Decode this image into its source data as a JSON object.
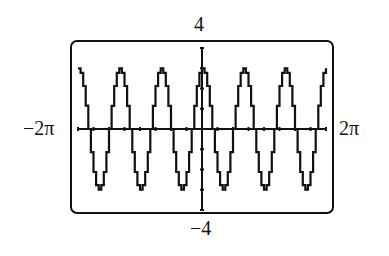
{
  "chart_data": {
    "type": "line",
    "title": "",
    "function": "y = 3cos(3x)",
    "xlabel": "",
    "ylabel": "",
    "xlim": [
      -6.2832,
      6.2832
    ],
    "ylim": [
      -4,
      4
    ],
    "x_tick_labels": {
      "min": "−2π",
      "max": "2π"
    },
    "y_tick_labels": {
      "max": "4",
      "min": "−4"
    },
    "x_tick_step": 0.7854,
    "y_tick_step": 1,
    "grid": false,
    "series": [
      {
        "name": "3cos(3x)",
        "amplitude": 3,
        "frequency": 3,
        "color": "#111111"
      }
    ]
  },
  "labels": {
    "ymax": "4",
    "ymin": "−4",
    "xmin": "−2π",
    "xmax": "2π"
  }
}
